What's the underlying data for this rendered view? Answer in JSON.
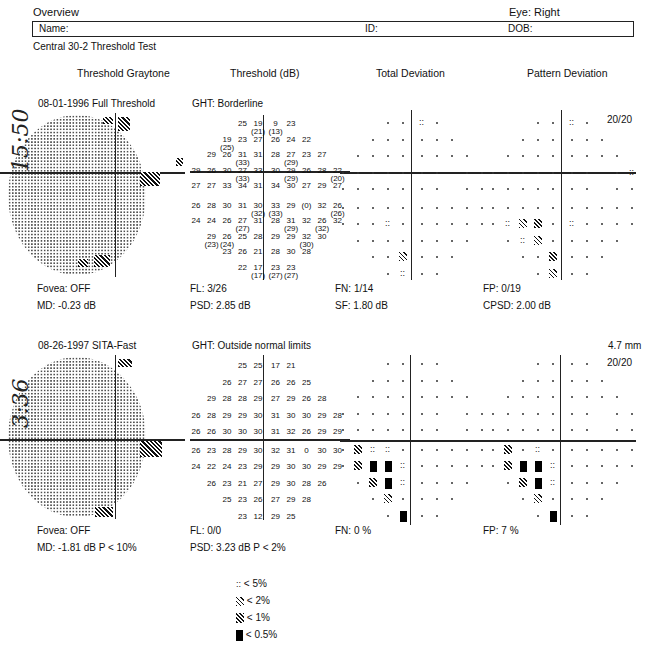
{
  "header": {
    "title": "Overview",
    "eye": "Eye: Right",
    "name_label": "Name:",
    "id_label": "ID:",
    "dob_label": "DOB:",
    "test_name": "Central 30-2 Threshold Test"
  },
  "columns": [
    "Threshold Graytone",
    "Threshold (dB)",
    "Total Deviation",
    "Pattern Deviation"
  ],
  "tests": [
    {
      "handwritten": "15:50",
      "date_strategy": "08-01-1996  Full Threshold",
      "ght": "GHT: Borderline",
      "pupil": "",
      "fixation": "20/20",
      "threshold_rows": [
        [
          "25",
          "19 (21)",
          "9 (13)",
          "23"
        ],
        [
          "19 (25)",
          "23",
          "27",
          "26",
          "24",
          "22"
        ],
        [
          "29",
          "26",
          "31 (33)",
          "31",
          "28",
          "27 (29)",
          "23",
          "27"
        ],
        [
          "29",
          "26",
          "30",
          "27 (33)",
          "33",
          "30",
          "29 (29)",
          "26",
          "28",
          "22 (20)"
        ],
        [
          "27",
          "27",
          "33",
          "34",
          "31",
          "34",
          "30",
          "27",
          "29",
          "27"
        ],
        [
          "26",
          "28",
          "30",
          "31",
          "30 (32)",
          "33 (33)",
          "29",
          "(0)",
          "32",
          "26 (26)"
        ],
        [
          "24",
          "24",
          "26",
          "27 (27)",
          "31",
          "28",
          "31 (29)",
          "32",
          "26 (32)",
          "32"
        ],
        [
          "29 (23)",
          "26 (24)",
          "25",
          "28",
          "29",
          "29",
          "32 (30)",
          "30"
        ],
        [
          "23",
          "26",
          "21",
          "28",
          "30",
          "28"
        ],
        [
          "22",
          "17 (17)",
          "23 (27)",
          "23 (27)"
        ]
      ],
      "stats": {
        "fovea": "Fovea: OFF",
        "fl": "FL: 3/26",
        "fn": "FN: 1/14",
        "fp": "FP: 0/19",
        "md": "MD:  -0.23 dB",
        "psd": "PSD:  2.85 dB",
        "sf": "SF:   1.80 dB",
        "cpsd": "CPSD:  2.00 dB"
      }
    },
    {
      "handwritten": "3:36",
      "date_strategy": "08-26-1997  SITA-Fast",
      "ght": "GHT: Outside normal limits",
      "pupil": "4.7 mm",
      "fixation": "20/20",
      "threshold_rows": [
        [
          "25",
          "25",
          "17",
          "21"
        ],
        [
          "26",
          "27",
          "27",
          "26",
          "26",
          "25"
        ],
        [
          "29",
          "28",
          "28",
          "29",
          "27",
          "29",
          "26",
          "28"
        ],
        [
          "26",
          "28",
          "29",
          "29",
          "30",
          "31",
          "30",
          "30",
          "29",
          "28"
        ],
        [
          "26",
          "26",
          "30",
          "30",
          "30",
          "31",
          "32",
          "26",
          "29",
          "29"
        ],
        [
          "26",
          "23",
          "28",
          "29",
          "30",
          "32",
          "31",
          "0",
          "30",
          "30"
        ],
        [
          "24",
          "22",
          "24",
          "23",
          "29",
          "29",
          "30",
          "30",
          "29",
          "29"
        ],
        [
          "26",
          "23",
          "21",
          "27",
          "29",
          "30",
          "28",
          "26"
        ],
        [
          "25",
          "23",
          "26",
          "27",
          "29",
          "28"
        ],
        [
          "23",
          "12",
          "29",
          "25"
        ]
      ],
      "stats": {
        "fovea": "Fovea: OFF",
        "fl": "FL: 0/0",
        "fn": "FN:  0 %",
        "fp": "FP:  7 %",
        "md": "MD:  -1.81 dB  P < 10%",
        "psd": "PSD:  3.23 dB  P < 2%"
      }
    }
  ],
  "legend": [
    {
      "symbol": "dots",
      "label": "< 5%"
    },
    {
      "symbol": "sparse-hatch",
      "label": "< 2%"
    },
    {
      "symbol": "dense-hatch",
      "label": "< 1%"
    },
    {
      "symbol": "solid",
      "label": "< 0.5%"
    }
  ]
}
